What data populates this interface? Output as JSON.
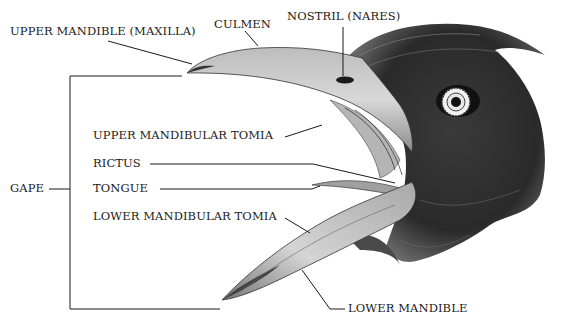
{
  "diagram": {
    "labels": {
      "upper_mandible": "UPPER MANDIBLE (MAXILLA)",
      "culmen": "CULMEN",
      "nostril": "NOSTRIL (NARES)",
      "upper_tomia": "UPPER MANDIBULAR TOMIA",
      "rictus": "RICTUS",
      "tongue": "TONGUE",
      "lower_tomia": "LOWER MANDIBULAR TOMIA",
      "gape": "GAPE",
      "lower_mandible": "LOWER MANDIBLE"
    },
    "colors": {
      "ink": "#1a1a1a",
      "beak_fill": "#cfcfcf",
      "feather_dark": "#2a2a2a",
      "background": "#ffffff"
    }
  }
}
